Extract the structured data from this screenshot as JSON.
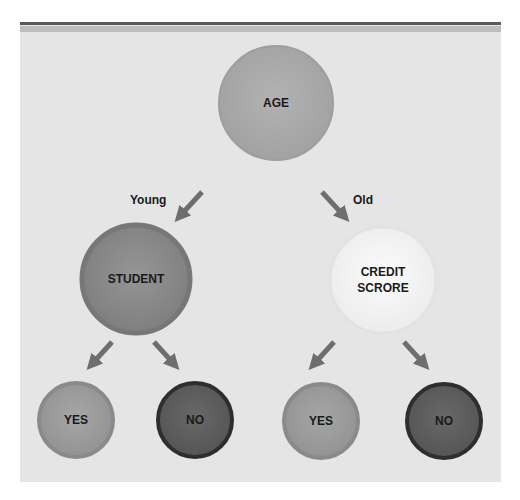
{
  "diagram": {
    "type": "decision-tree",
    "root": {
      "label": "AGE",
      "fill": "#a9a9a9",
      "stroke": "#9a9a9a"
    },
    "edges": {
      "young": "Young",
      "old": "Old"
    },
    "nodes": {
      "student": {
        "label": "STUDENT",
        "fill": "#8a8a8a",
        "stroke": "#7a7a7a"
      },
      "credit_score": {
        "label": "CREDIT\nSCRORE",
        "fill": "#f4f4f4",
        "stroke": "#e0e0e0"
      }
    },
    "leaves": [
      {
        "label": "YES",
        "fill": "#9d9d9d",
        "stroke": "#8c8c8c"
      },
      {
        "label": "NO",
        "fill": "#5c5c5c",
        "stroke": "#2f2f2f"
      },
      {
        "label": "YES",
        "fill": "#9d9d9d",
        "stroke": "#8c8c8c"
      },
      {
        "label": "NO",
        "fill": "#5c5c5c",
        "stroke": "#2f2f2f"
      }
    ],
    "arrow_color": "#6e6e6e"
  }
}
